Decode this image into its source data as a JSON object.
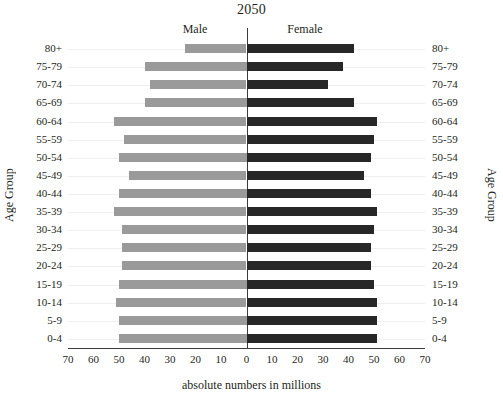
{
  "chart_data": {
    "type": "bar",
    "subtype": "population-pyramid",
    "title": "2050",
    "xlabel": "absolute numbers in millions",
    "ylabel": "Age Group",
    "ylabel_right": "Age Group",
    "orientation": "horizontal",
    "grid": true,
    "legend_position": "top-inline",
    "categories": [
      "0-4",
      "5-9",
      "10-14",
      "15-19",
      "20-24",
      "25-29",
      "30-34",
      "35-39",
      "40-44",
      "45-49",
      "50-54",
      "55-59",
      "60-64",
      "65-69",
      "70-74",
      "75-79",
      "80+"
    ],
    "xlim": [
      -70,
      70
    ],
    "xticks": [
      70,
      60,
      50,
      40,
      30,
      20,
      10,
      0,
      10,
      20,
      30,
      40,
      50,
      60,
      70
    ],
    "xtick_values": [
      -70,
      -60,
      -50,
      -40,
      -30,
      -20,
      -10,
      0,
      10,
      20,
      30,
      40,
      50,
      60,
      70
    ],
    "series": [
      {
        "name": "Male",
        "side": "left",
        "color": "#9a9a9a",
        "values": [
          50,
          50,
          51,
          50,
          49,
          49,
          49,
          52,
          50,
          46,
          50,
          48,
          52,
          40,
          38,
          40,
          24
        ]
      },
      {
        "name": "Female",
        "side": "right",
        "color": "#272727",
        "values": [
          51,
          51,
          51,
          50,
          49,
          49,
          50,
          51,
          49,
          46,
          49,
          50,
          51,
          42,
          32,
          38,
          42
        ]
      }
    ]
  },
  "labels": {
    "male_caption": "Male",
    "female_caption": "Female"
  }
}
